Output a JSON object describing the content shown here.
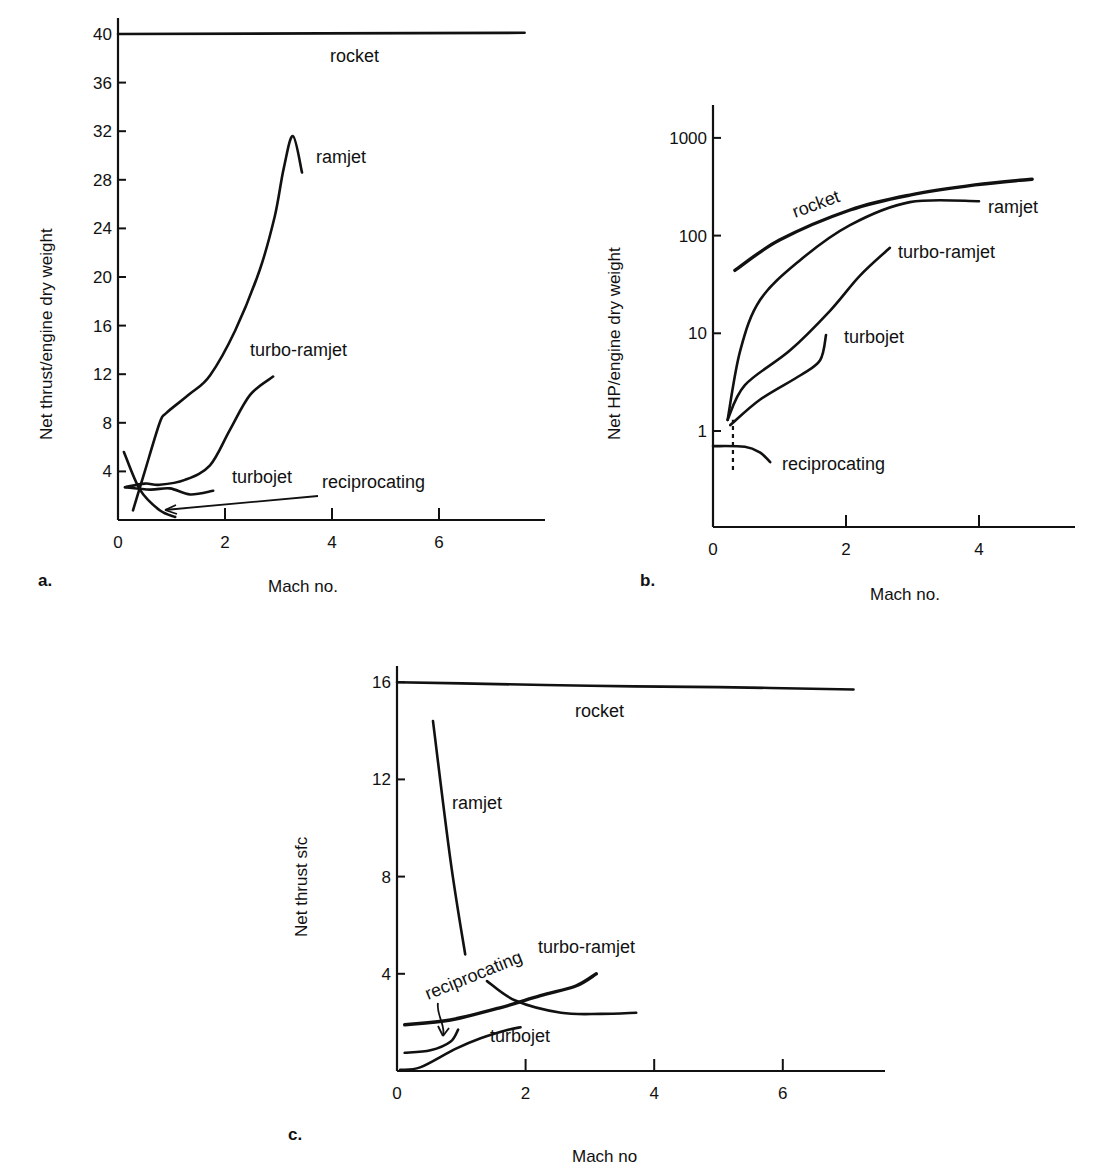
{
  "chart_data": [
    {
      "id": "a",
      "type": "line",
      "panel_label": "a.",
      "title": "",
      "xlabel": "Mach no.",
      "ylabel": "Net thrust/engine dry weight",
      "xlim": [
        0,
        8
      ],
      "ylim": [
        0,
        40
      ],
      "yscale": "linear",
      "xticks": [
        0,
        2,
        4,
        6
      ],
      "xtick_labels": [
        "0",
        "2",
        "4",
        "6"
      ],
      "yticks": [
        4,
        8,
        12,
        16,
        20,
        24,
        28,
        32,
        36,
        40
      ],
      "ytick_labels": [
        "4",
        "8",
        "12",
        "16",
        "20",
        "24",
        "28",
        "32",
        "36",
        "40"
      ],
      "grid": false,
      "series": [
        {
          "name": "rocket",
          "label": "rocket",
          "x": [
            0,
            7.6
          ],
          "y": [
            40,
            40.1
          ]
        },
        {
          "name": "ramjet",
          "label": "ramjet",
          "x": [
            0.28,
            0.5,
            0.78,
            0.9,
            1.35,
            1.72,
            2.19,
            2.65,
            2.93,
            3.1,
            3.27,
            3.44
          ],
          "y": [
            0.8,
            4.0,
            8.0,
            8.8,
            10.4,
            11.9,
            15.6,
            20.6,
            25.0,
            29.0,
            31.6,
            28.6
          ]
        },
        {
          "name": "turbo-ramjet",
          "label": "turbo-ramjet",
          "x": [
            0.13,
            0.5,
            0.78,
            1.25,
            1.72,
            2.09,
            2.47,
            2.9
          ],
          "y": [
            2.7,
            3.0,
            2.9,
            3.3,
            4.5,
            7.4,
            10.3,
            11.8
          ]
        },
        {
          "name": "turbojet",
          "label": "turbojet",
          "x": [
            0.13,
            0.6,
            0.97,
            1.35,
            1.78
          ],
          "y": [
            2.7,
            2.5,
            2.6,
            2.1,
            2.4
          ]
        },
        {
          "name": "reciprocating",
          "label": "reciprocating",
          "x": [
            0.11,
            0.41,
            0.78,
            1.07
          ],
          "y": [
            5.6,
            2.5,
            0.8,
            0.25
          ]
        }
      ],
      "annotations": [
        {
          "text": "reciprocating",
          "arrow_to": [
            0.95,
            0.6
          ]
        }
      ]
    },
    {
      "id": "b",
      "type": "line",
      "panel_label": "b.",
      "title": "",
      "xlabel": "Mach no.",
      "ylabel": "Net HP/engine dry weight",
      "xlim": [
        0,
        5.5
      ],
      "ylim": [
        0.1,
        2000
      ],
      "yscale": "log",
      "xticks": [
        0,
        2,
        4
      ],
      "xtick_labels": [
        "0",
        "2",
        "4"
      ],
      "yticks": [
        1,
        10,
        100,
        1000
      ],
      "ytick_labels": [
        "1",
        "10",
        "100",
        "1000"
      ],
      "grid": false,
      "series": [
        {
          "name": "rocket",
          "label": "rocket",
          "x": [
            0.33,
            1.0,
            2.06,
            2.96,
            3.94,
            4.8
          ],
          "y": [
            44,
            90,
            183,
            260,
            330,
            378
          ]
        },
        {
          "name": "ramjet",
          "label": "ramjet",
          "x": [
            0.22,
            0.41,
            0.71,
            1.31,
            2.06,
            2.96,
            4.0
          ],
          "y": [
            1.3,
            6.7,
            22,
            56,
            128,
            220,
            225
          ]
        },
        {
          "name": "turbo-ramjet",
          "label": "turbo-ramjet",
          "x": [
            0.22,
            0.48,
            1.16,
            1.76,
            2.21,
            2.66
          ],
          "y": [
            1.3,
            2.95,
            6.7,
            17,
            39,
            75
          ]
        },
        {
          "name": "turbojet",
          "label": "turbojet",
          "x": [
            0.26,
            0.71,
            1.31,
            1.61,
            1.7
          ],
          "y": [
            1.15,
            2.1,
            3.7,
            5.3,
            9.6
          ]
        },
        {
          "name": "reciprocating",
          "label": "reciprocating",
          "x": [
            0,
            0.48,
            0.71,
            0.86
          ],
          "y": [
            0.7,
            0.69,
            0.6,
            0.48
          ]
        }
      ],
      "annotations": [
        {
          "text": "",
          "type": "dashed-vertical",
          "x": 0.3,
          "y_from": 0.4,
          "y_to": 1.3
        }
      ]
    },
    {
      "id": "c",
      "type": "line",
      "panel_label": "c.",
      "title": "",
      "xlabel": "Mach no",
      "ylabel": "Net thrust sfc",
      "xlim": [
        0,
        7.5
      ],
      "ylim": [
        0,
        16
      ],
      "yscale": "linear",
      "xticks": [
        0,
        2,
        4,
        6
      ],
      "xtick_labels": [
        "0",
        "2",
        "4",
        "6"
      ],
      "yticks": [
        4,
        8,
        12,
        16
      ],
      "ytick_labels": [
        "4",
        "8",
        "12",
        "16"
      ],
      "grid": false,
      "series": [
        {
          "name": "rocket",
          "label": "rocket",
          "x": [
            0,
            1.0,
            3.0,
            5.0,
            7.1
          ],
          "y": [
            16.0,
            15.95,
            15.85,
            15.8,
            15.7
          ]
        },
        {
          "name": "ramjet",
          "label": "ramjet",
          "x": [
            0.56,
            0.83,
            1.06
          ],
          "y": [
            14.4,
            8.7,
            4.8
          ]
        },
        {
          "name": "ramjet-high",
          "label": "",
          "x": [
            1.4,
            1.84,
            2.55,
            3.17,
            3.72
          ],
          "y": [
            3.7,
            2.9,
            2.4,
            2.35,
            2.4
          ]
        },
        {
          "name": "turbo-ramjet",
          "label": "turbo-ramjet",
          "x": [
            0.12,
            0.83,
            1.6,
            2.23,
            2.78,
            3.1
          ],
          "y": [
            1.9,
            2.1,
            2.6,
            3.1,
            3.5,
            4.0
          ]
        },
        {
          "name": "turbojet",
          "label": "turbojet",
          "x": [
            0.05,
            0.36,
            0.9,
            1.3,
            1.73,
            1.92
          ],
          "y": [
            0.05,
            0.15,
            0.9,
            1.35,
            1.7,
            1.8
          ]
        },
        {
          "name": "reciprocating",
          "label": "reciprocating",
          "x": [
            0.12,
            0.52,
            0.83,
            0.95
          ],
          "y": [
            0.75,
            0.85,
            1.2,
            1.7
          ]
        }
      ],
      "annotations": [
        {
          "text": "reciprocating",
          "arrow_to": [
            0.7,
            1.3
          ]
        }
      ]
    }
  ]
}
